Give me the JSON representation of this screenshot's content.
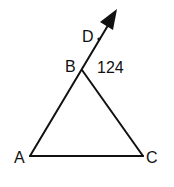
{
  "diagram": {
    "type": "triangle-with-exterior-ray",
    "points": {
      "A": {
        "label": "A",
        "x": 30,
        "y": 156
      },
      "B": {
        "label": "B",
        "x": 82,
        "y": 70
      },
      "C": {
        "label": "C",
        "x": 143,
        "y": 156
      },
      "D": {
        "label": "D",
        "x": 99,
        "y": 39
      }
    },
    "segments": [
      "AB",
      "BC",
      "AC"
    ],
    "ray": {
      "from": "A",
      "through": "B",
      "extends_past": "D",
      "arrowhead": true
    },
    "angle_annotation": {
      "vertex": "B",
      "between": [
        "D",
        "C"
      ],
      "value": "124"
    },
    "colors": {
      "stroke": "#111111",
      "background": "#ffffff"
    }
  }
}
